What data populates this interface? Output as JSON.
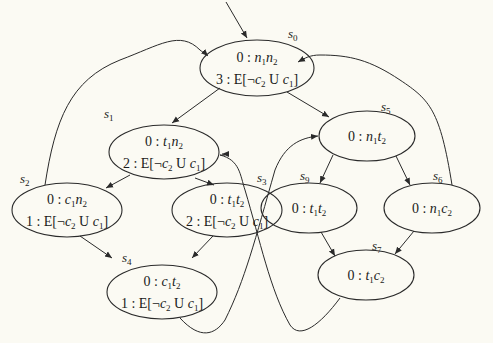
{
  "diagram": {
    "type": "kripke-structure",
    "background": "#fbfaf3",
    "initial_state": "s0",
    "states": [
      {
        "id": "s0",
        "label": "s0",
        "line1": {
          "prefix": "0 : ",
          "vars": [
            [
              "n",
              "1"
            ],
            [
              "n",
              "2"
            ]
          ]
        },
        "line2": {
          "prefix": "3 : ",
          "formula": "E[¬c2 U c1]"
        }
      },
      {
        "id": "s1",
        "label": "s1",
        "line1": {
          "prefix": "0 : ",
          "vars": [
            [
              "t",
              "1"
            ],
            [
              "n",
              "2"
            ]
          ]
        },
        "line2": {
          "prefix": "2 : ",
          "formula": "E[¬c2 U c1]"
        }
      },
      {
        "id": "s2",
        "label": "s2",
        "line1": {
          "prefix": "0 : ",
          "vars": [
            [
              "c",
              "1"
            ],
            [
              "n",
              "2"
            ]
          ]
        },
        "line2": {
          "prefix": "1 : ",
          "formula": "E[¬c2 U c1]"
        }
      },
      {
        "id": "s3",
        "label": "s3",
        "line1": {
          "prefix": "0 : ",
          "vars": [
            [
              "t",
              "1"
            ],
            [
              "t",
              "2"
            ]
          ]
        },
        "line2": {
          "prefix": "2 : ",
          "formula": "E[¬c2 U c1]"
        }
      },
      {
        "id": "s4",
        "label": "s4",
        "line1": {
          "prefix": "0 : ",
          "vars": [
            [
              "c",
              "1"
            ],
            [
              "t",
              "2"
            ]
          ]
        },
        "line2": {
          "prefix": "1 : ",
          "formula": "E[¬c2 U c1]"
        }
      },
      {
        "id": "s5",
        "label": "s5",
        "line1": {
          "prefix": "0 : ",
          "vars": [
            [
              "n",
              "1"
            ],
            [
              "t",
              "2"
            ]
          ]
        }
      },
      {
        "id": "s6",
        "label": "s6",
        "line1": {
          "prefix": "0 : ",
          "vars": [
            [
              "n",
              "1"
            ],
            [
              "c",
              "2"
            ]
          ]
        }
      },
      {
        "id": "s7",
        "label": "s7",
        "line1": {
          "prefix": "0 : ",
          "vars": [
            [
              "t",
              "1"
            ],
            [
              "c",
              "2"
            ]
          ]
        }
      },
      {
        "id": "s9",
        "label": "s9",
        "line1": {
          "prefix": "0 : ",
          "vars": [
            [
              "t",
              "1"
            ],
            [
              "t",
              "2"
            ]
          ]
        }
      }
    ],
    "transitions": [
      {
        "from": "s0",
        "to": "s1"
      },
      {
        "from": "s0",
        "to": "s5"
      },
      {
        "from": "s1",
        "to": "s2"
      },
      {
        "from": "s1",
        "to": "s3"
      },
      {
        "from": "s2",
        "to": "s0"
      },
      {
        "from": "s2",
        "to": "s4"
      },
      {
        "from": "s3",
        "to": "s4"
      },
      {
        "from": "s4",
        "to": "s5"
      },
      {
        "from": "s5",
        "to": "s9"
      },
      {
        "from": "s5",
        "to": "s6"
      },
      {
        "from": "s6",
        "to": "s0"
      },
      {
        "from": "s6",
        "to": "s7"
      },
      {
        "from": "s9",
        "to": "s7"
      },
      {
        "from": "s7",
        "to": "s1"
      }
    ]
  }
}
